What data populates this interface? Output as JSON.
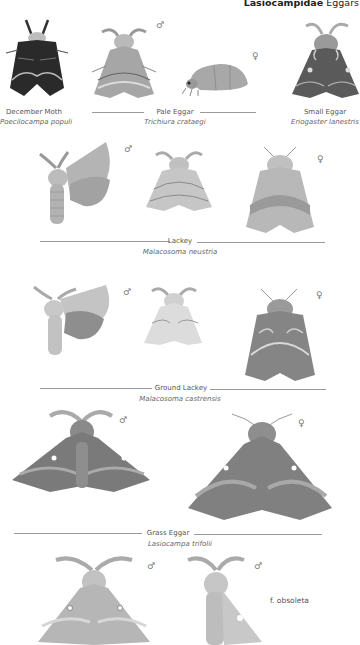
{
  "header": {
    "family": "Lasiocampidae",
    "common": "Eggars"
  },
  "species": [
    {
      "common": "December Moth",
      "scientific": "Poecilocampa populi"
    },
    {
      "common": "Pale Eggar",
      "scientific": "Trichiura crataegi"
    },
    {
      "common": "Small Eggar",
      "scientific": "Eriogaster lanestris"
    },
    {
      "common": "Lackey",
      "scientific": "Malacosoma neustria"
    },
    {
      "common": "Ground Lackey",
      "scientific": "Malacosoma castrensis"
    },
    {
      "common": "Grass Eggar",
      "scientific": "Lasiocampa trifolii"
    }
  ],
  "symbols": {
    "male": "♂",
    "female": "♀"
  },
  "notes": {
    "form": "f. obsoleta"
  },
  "colors": {
    "background": "#ffffff",
    "rule": "#9a9a9a",
    "text": "#555555"
  }
}
